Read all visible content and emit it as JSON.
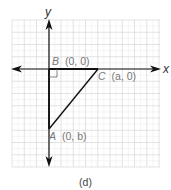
{
  "figure": {
    "caption": "(d)",
    "axes": {
      "x_label": "x",
      "y_label": "y"
    },
    "points": [
      {
        "id": "B",
        "name": "B",
        "coords": "(0, 0)"
      },
      {
        "id": "C",
        "name": "C",
        "coords": "(a, 0)"
      },
      {
        "id": "A",
        "name": "A",
        "coords": "(0, b)"
      }
    ],
    "shape": "right triangle ABC with right angle at B",
    "colors": {
      "grid_major": "#dcdcdc",
      "grid_minor": "#efefef",
      "lines": "#111111",
      "labels": "#777777"
    }
  }
}
